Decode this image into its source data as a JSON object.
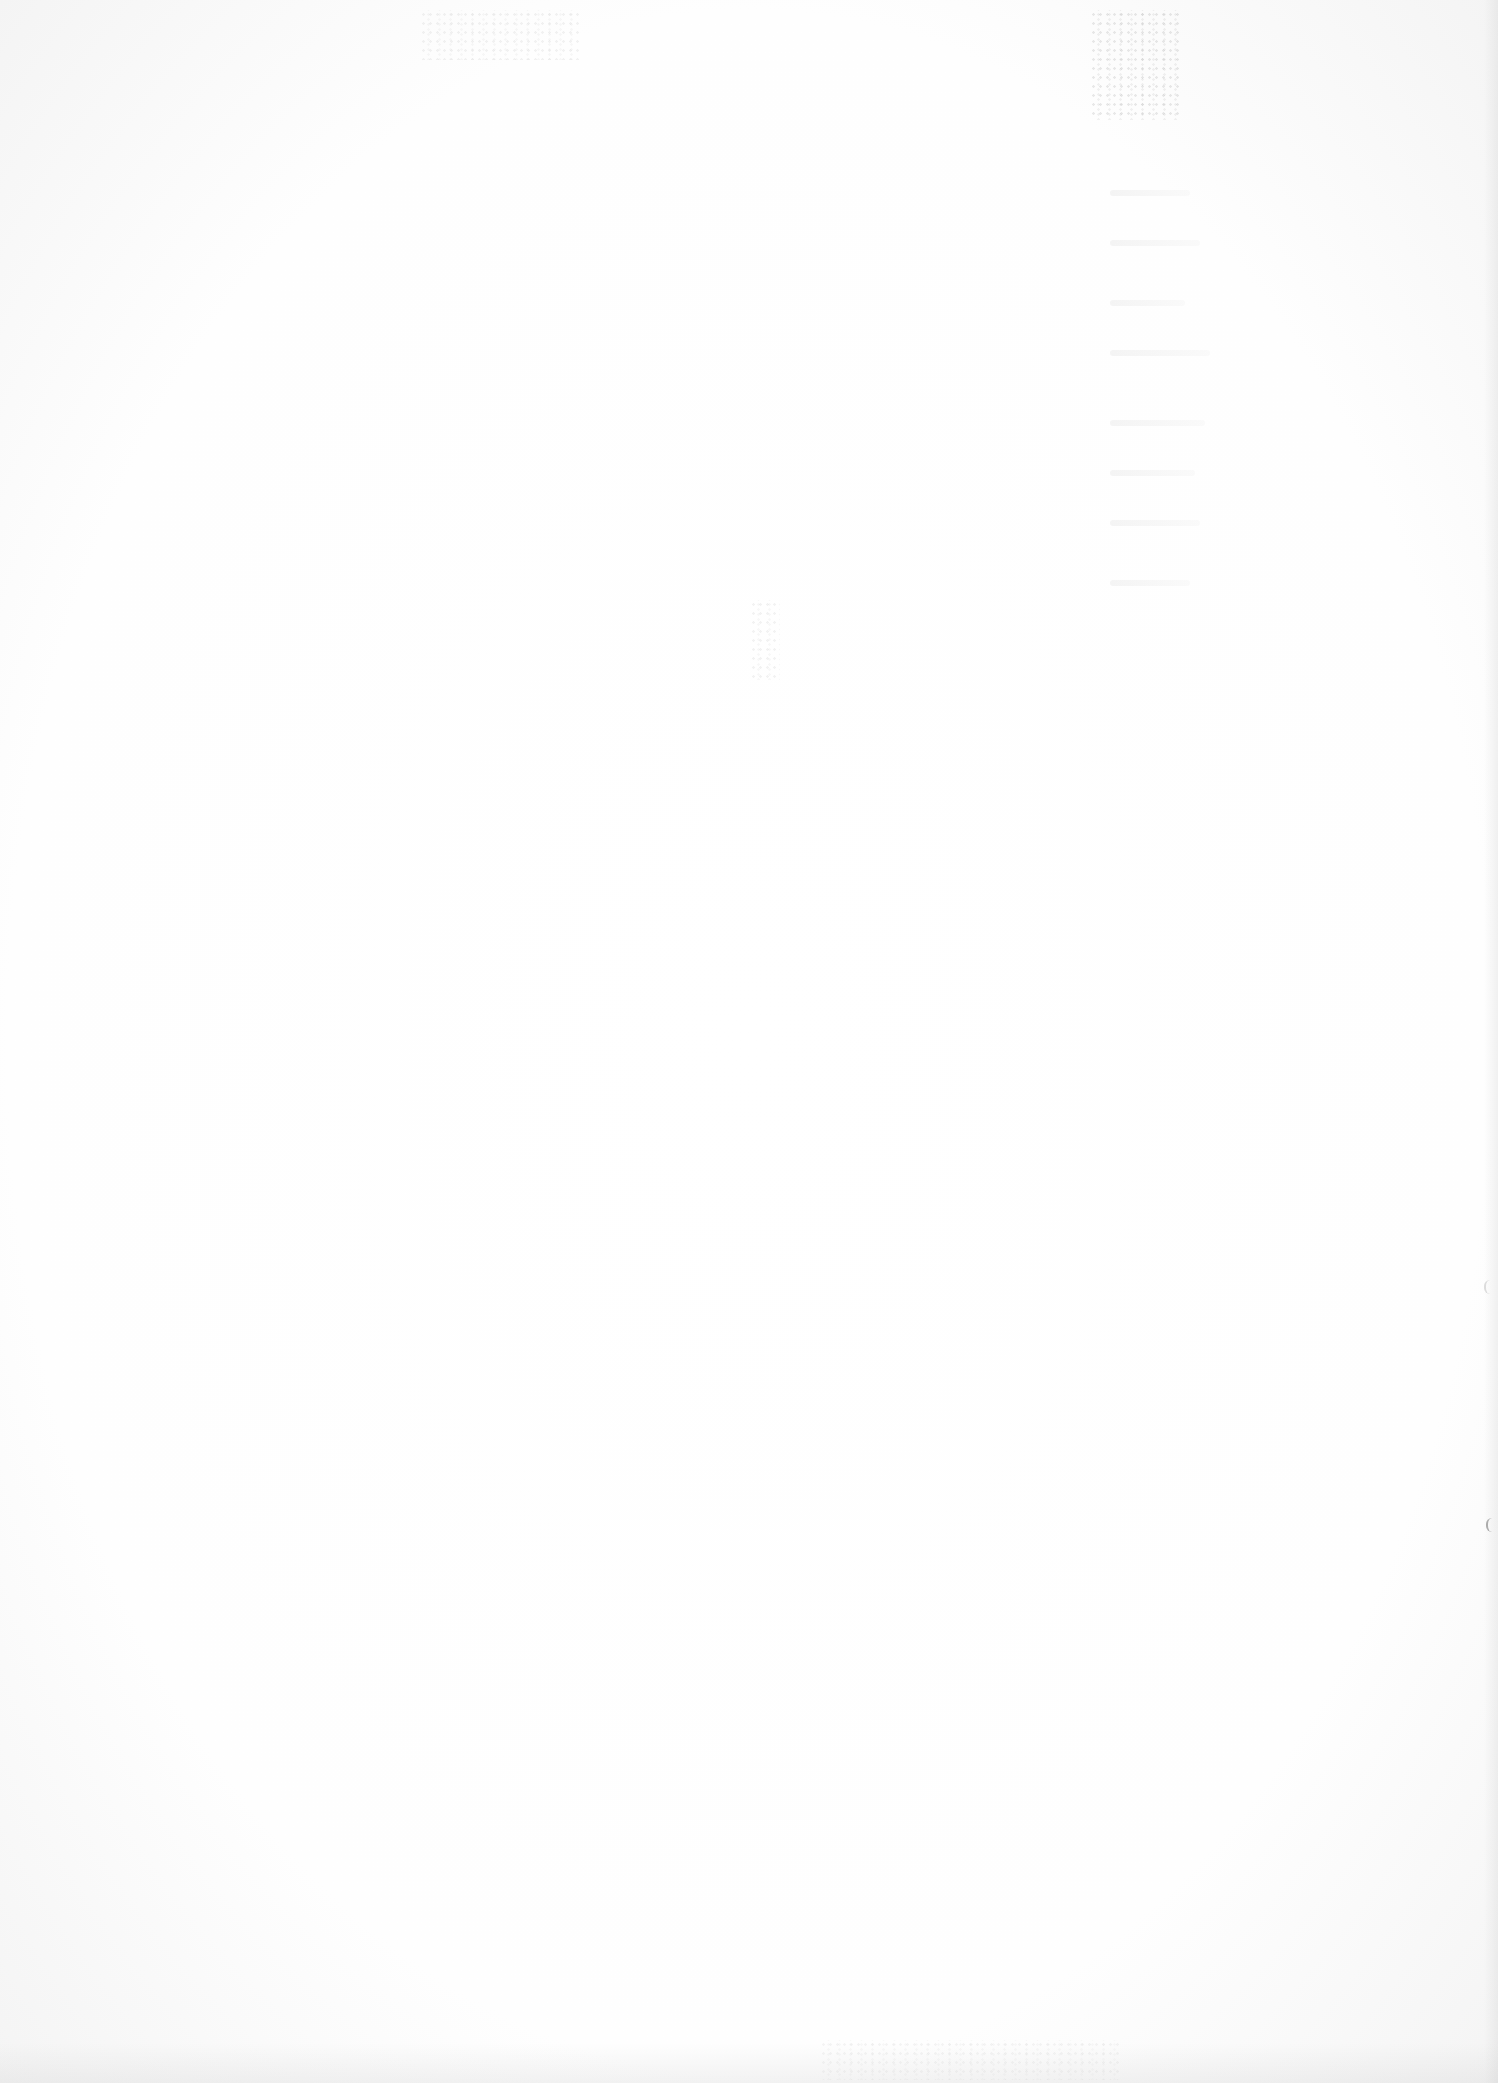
{
  "document": {
    "type": "blank-scanned-page",
    "text_content": "",
    "background_color": "#fdfdfd",
    "artifacts": [
      {
        "kind": "bleed-through-speckle",
        "region": "top-right"
      },
      {
        "kind": "bleed-through-speckle",
        "region": "upper-middle"
      },
      {
        "kind": "edge-mark",
        "region": "right-edge"
      }
    ]
  }
}
